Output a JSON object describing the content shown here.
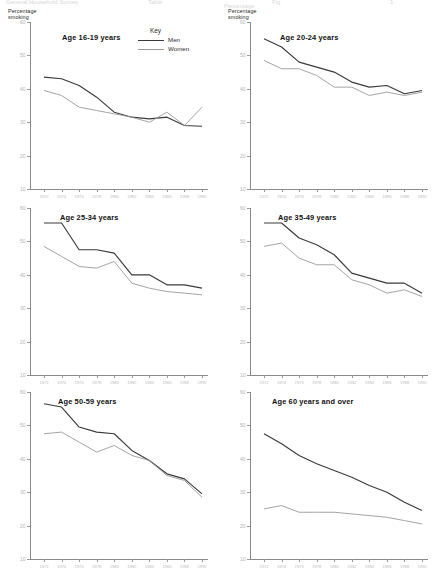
{
  "figure": {
    "top_cut_fragments": [
      {
        "text": "General Household Survey",
        "x": 6
      },
      {
        "text": "Table",
        "x": 148
      },
      {
        "text": "Fig",
        "x": 272
      },
      {
        "text": "1",
        "x": 390
      }
    ],
    "top_cut_fragment2": {
      "text": "Percentage",
      "x": 224
    },
    "y_axis_label_line1": "Percentage",
    "y_axis_label_line2": "smoking",
    "y_ticks": [
      "60",
      "50",
      "40",
      "30",
      "20",
      "10"
    ],
    "x_ticks": [
      "1972",
      "1974",
      "1976",
      "1978",
      "1980",
      "1982",
      "1984",
      "1986",
      "1988",
      "1990"
    ],
    "key": {
      "title": "Key",
      "entries": [
        {
          "label": "Men",
          "color": "#3a3a3a",
          "width": "1.15"
        },
        {
          "label": "Women",
          "color": "#9a9a9a",
          "width": "0.9"
        }
      ]
    },
    "colors": {
      "men": "#3a3a3a",
      "women": "#9a9a9a",
      "axis": "#8a8a8a"
    }
  },
  "chart_data": [
    {
      "type": "line",
      "title": "Age 16-19 years",
      "xlabel": "",
      "ylabel": "Percentage smoking",
      "ylim": [
        10,
        60
      ],
      "grid": false,
      "x": [
        1972,
        1974,
        1976,
        1978,
        1980,
        1982,
        1984,
        1986,
        1988,
        1990
      ],
      "series": [
        {
          "name": "Men",
          "values": [
            43.5,
            43.0,
            41.0,
            37.5,
            33.0,
            31.5,
            31.0,
            31.5,
            29.0,
            28.8
          ]
        },
        {
          "name": "Women",
          "values": [
            39.5,
            38.0,
            34.5,
            33.5,
            32.5,
            31.5,
            30.0,
            33.0,
            29.0,
            34.5
          ]
        }
      ]
    },
    {
      "type": "line",
      "title": "Age 20-24 years",
      "xlabel": "",
      "ylabel": "Percentage smoking",
      "ylim": [
        10,
        60
      ],
      "grid": false,
      "x": [
        1972,
        1974,
        1976,
        1978,
        1980,
        1982,
        1984,
        1986,
        1988,
        1990
      ],
      "series": [
        {
          "name": "Men",
          "values": [
            55.0,
            52.5,
            48.0,
            46.5,
            45.0,
            42.0,
            40.5,
            41.0,
            38.5,
            39.5
          ]
        },
        {
          "name": "Women",
          "values": [
            48.5,
            46.0,
            46.0,
            44.0,
            40.5,
            40.5,
            38.0,
            39.0,
            38.0,
            39.0
          ]
        }
      ]
    },
    {
      "type": "line",
      "title": "Age 25-34 years",
      "xlabel": "",
      "ylabel": "Percentage smoking",
      "ylim": [
        10,
        60
      ],
      "grid": false,
      "x": [
        1972,
        1974,
        1976,
        1978,
        1980,
        1982,
        1984,
        1986,
        1988,
        1990
      ],
      "series": [
        {
          "name": "Men",
          "values": [
            55.5,
            55.5,
            47.5,
            47.5,
            46.5,
            40.0,
            40.0,
            37.0,
            37.0,
            36.0
          ]
        },
        {
          "name": "Women",
          "values": [
            48.5,
            45.5,
            42.5,
            42.0,
            44.0,
            37.5,
            36.0,
            35.0,
            34.5,
            34.0
          ]
        }
      ]
    },
    {
      "type": "line",
      "title": "Age 35-49 years",
      "xlabel": "",
      "ylabel": "Percentage smoking",
      "ylim": [
        10,
        60
      ],
      "grid": false,
      "x": [
        1972,
        1974,
        1976,
        1978,
        1980,
        1982,
        1984,
        1986,
        1988,
        1990
      ],
      "series": [
        {
          "name": "Men",
          "values": [
            55.5,
            55.5,
            51.0,
            49.0,
            46.0,
            40.5,
            39.0,
            37.5,
            37.5,
            34.5
          ]
        },
        {
          "name": "Women",
          "values": [
            48.5,
            49.5,
            45.0,
            43.0,
            43.0,
            38.5,
            37.0,
            34.5,
            35.5,
            33.5
          ]
        }
      ]
    },
    {
      "type": "line",
      "title": "Age 50-59 years",
      "xlabel": "",
      "ylabel": "Percentage smoking",
      "ylim": [
        10,
        60
      ],
      "grid": false,
      "x": [
        1972,
        1974,
        1976,
        1978,
        1980,
        1982,
        1984,
        1986,
        1988,
        1990
      ],
      "series": [
        {
          "name": "Men",
          "values": [
            56.5,
            55.5,
            49.5,
            48.0,
            47.5,
            42.5,
            39.5,
            35.5,
            34.0,
            29.5
          ]
        },
        {
          "name": "Women",
          "values": [
            47.5,
            48.0,
            45.0,
            42.0,
            44.0,
            41.0,
            39.5,
            35.0,
            33.5,
            28.5
          ]
        }
      ]
    },
    {
      "type": "line",
      "title": "Age 60 years and over",
      "xlabel": "",
      "ylabel": "Percentage smoking",
      "ylim": [
        10,
        60
      ],
      "grid": false,
      "x": [
        1972,
        1974,
        1976,
        1978,
        1980,
        1982,
        1984,
        1986,
        1988,
        1990
      ],
      "series": [
        {
          "name": "Men",
          "values": [
            47.5,
            44.5,
            41.0,
            38.5,
            36.5,
            34.5,
            32.0,
            30.0,
            27.0,
            24.5
          ]
        },
        {
          "name": "Women",
          "values": [
            25.0,
            26.0,
            24.0,
            24.0,
            24.0,
            23.5,
            23.0,
            22.5,
            21.5,
            20.5
          ]
        }
      ]
    }
  ]
}
